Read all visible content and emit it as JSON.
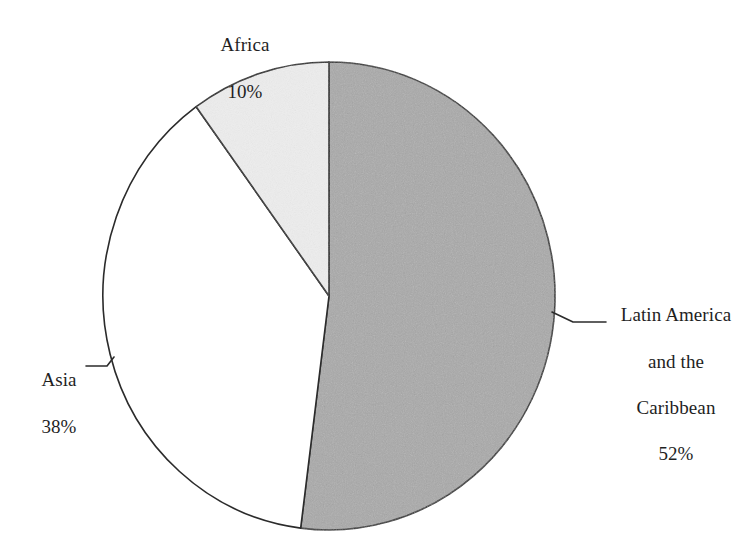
{
  "chart_data": {
    "type": "pie",
    "title": "",
    "subtitle": "",
    "xlabel": "",
    "ylabel": "",
    "legend_position": "none",
    "grid": false,
    "labels_outside": true,
    "start_angle_deg": 0,
    "direction": "clockwise",
    "categories": [
      "Latin America and the Caribbean",
      "Asia",
      "Africa"
    ],
    "values": [
      52,
      38,
      10
    ],
    "units": "percent",
    "slices": [
      {
        "name": "Latin America and the Caribbean",
        "label_lines": [
          "Latin America",
          "and the",
          "Caribbean"
        ],
        "value": 52,
        "value_text": "52%",
        "color": "#a9a9a9",
        "start_angle_deg": 0,
        "end_angle_deg": 187.2
      },
      {
        "name": "Asia",
        "label_lines": [
          "Asia"
        ],
        "value": 38,
        "value_text": "38%",
        "color": "#ffffff",
        "start_angle_deg": 187.2,
        "end_angle_deg": 324.0
      },
      {
        "name": "Africa",
        "label_lines": [
          "Africa"
        ],
        "value": 10,
        "value_text": "10%",
        "color": "#ededed",
        "start_angle_deg": 324.0,
        "end_angle_deg": 360.0
      }
    ]
  },
  "labels": {
    "africa": {
      "name": "Africa",
      "value_text": "10%"
    },
    "asia": {
      "name": "Asia",
      "value_text": "38%"
    },
    "latin_america": {
      "line1": "Latin America",
      "line2": "and the",
      "line3": "Caribbean",
      "value_text": "52%"
    }
  },
  "colors": {
    "background": "#ffffff",
    "outline": "#2b2b2b",
    "slice_latin_america": "#a9a9a9",
    "slice_asia": "#ffffff",
    "slice_africa": "#ededed",
    "text": "#1f1f1f"
  }
}
